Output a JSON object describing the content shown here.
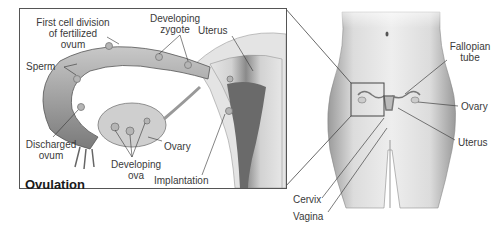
{
  "inset": {
    "title": "Ovulation",
    "labels": {
      "first_cell_division_1": "First cell division",
      "first_cell_division_2": "of fertilized",
      "first_cell_division_3": "ovum",
      "developing_zygote_1": "Developing",
      "developing_zygote_2": "zygote",
      "uterus": "Uterus",
      "sperm": "Sperm",
      "discharged_ovum_1": "Discharged",
      "discharged_ovum_2": "ovum",
      "ovary": "Ovary",
      "developing_ova_1": "Developing",
      "developing_ova_2": "ova",
      "implantation": "Implantation"
    }
  },
  "body_figure": {
    "labels": {
      "fallopian_tube_1": "Fallopian",
      "fallopian_tube_2": "tube",
      "ovary": "Ovary",
      "uterus": "Uterus",
      "cervix": "Cervix",
      "vagina": "Vagina"
    }
  },
  "colors": {
    "line": "#3a3a3a",
    "tissue_dark": "#7d7d7d",
    "tissue_light": "#d9d9d9",
    "skin": "#cfcfcf"
  }
}
